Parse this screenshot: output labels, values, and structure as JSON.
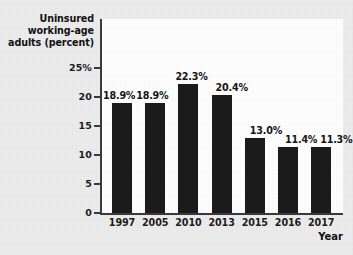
{
  "chart_data": {
    "type": "bar",
    "title": "",
    "xlabel": "Year",
    "ylabel": "Uninsured working-age adults (percent)",
    "ylabel_lines": [
      "Uninsured",
      "working-age",
      "adults (percent)"
    ],
    "categories": [
      "1997",
      "2005",
      "2010",
      "2013",
      "2015",
      "2016",
      "2017"
    ],
    "values": [
      18.9,
      18.9,
      22.3,
      20.4,
      13.0,
      11.4,
      11.3
    ],
    "value_labels": [
      "18.9%",
      "18.9%",
      "22.3%",
      "20.4%",
      "13.0%",
      "11.4%",
      "11.3%"
    ],
    "ylim": [
      0,
      26
    ],
    "yticks": [
      0,
      5,
      10,
      15,
      20,
      25
    ],
    "ytick_labels": [
      "0",
      "5",
      "10",
      "15",
      "20",
      "25%"
    ],
    "grid": false,
    "legend": null,
    "bar_color": "#1b1b1b",
    "axis_color": "#3a3a3a",
    "plot_background": "#fdfdfd",
    "page_background": "#ebebeb"
  }
}
